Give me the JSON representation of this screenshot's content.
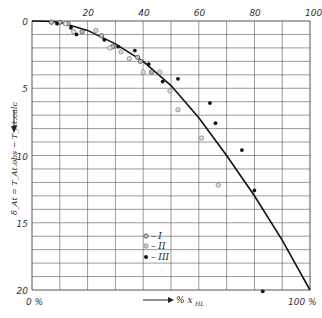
{
  "chart_data": {
    "type": "scatter",
    "title": "",
    "xlabel": "% x_HL",
    "ylabel": "δ_At = T_At.obs − T_At.calc",
    "xlim": [
      0,
      100
    ],
    "ylim": [
      0,
      20
    ],
    "y_inverted": true,
    "x_ticks": [
      "0 %",
      "20",
      "40",
      "60",
      "80",
      "100",
      "100 %"
    ],
    "x_tick_values": [
      20,
      40,
      60,
      80,
      100
    ],
    "y_ticks": [
      0,
      5,
      10,
      15,
      20
    ],
    "grid": true,
    "legend": [
      {
        "marker": "open-circle-dot",
        "label": "I"
      },
      {
        "marker": "gray-circle",
        "label": "II"
      },
      {
        "marker": "filled-dot",
        "label": "III"
      }
    ],
    "legend_position": "lower-center",
    "curve": {
      "name": "theoretical",
      "x": [
        0,
        5,
        10,
        20,
        30,
        40,
        50,
        60,
        70,
        80,
        90,
        100
      ],
      "y": [
        0,
        0.02,
        0.1,
        0.7,
        1.7,
        3.0,
        4.8,
        7.2,
        10.0,
        13.0,
        16.3,
        20.0
      ]
    },
    "series": [
      {
        "name": "I",
        "points": [
          [
            7,
            0.1
          ],
          [
            10,
            0.1
          ],
          [
            13,
            0.2
          ],
          [
            18,
            0.8
          ],
          [
            25,
            1.1
          ],
          [
            29,
            1.9
          ],
          [
            38,
            2.7
          ],
          [
            39,
            3.0
          ],
          [
            43,
            3.8
          ]
        ]
      },
      {
        "name": "II",
        "points": [
          [
            12,
            0.2
          ],
          [
            15,
            0.8
          ],
          [
            23,
            0.7
          ],
          [
            28,
            2.0
          ],
          [
            32,
            2.3
          ],
          [
            35,
            2.8
          ],
          [
            40,
            3.8
          ],
          [
            46,
            3.8
          ],
          [
            49.6,
            5.2
          ],
          [
            52.5,
            6.6
          ],
          [
            61,
            8.7
          ],
          [
            67,
            12.2
          ]
        ]
      },
      {
        "name": "III",
        "points": [
          [
            9,
            0.2
          ],
          [
            14,
            0.5
          ],
          [
            16,
            1.0
          ],
          [
            26,
            1.4
          ],
          [
            31,
            1.9
          ],
          [
            37,
            2.2
          ],
          [
            42,
            3.2
          ],
          [
            47,
            4.5
          ],
          [
            52.5,
            4.3
          ],
          [
            64,
            6.1
          ],
          [
            66,
            7.6
          ],
          [
            75.5,
            9.6
          ],
          [
            80,
            12.6
          ],
          [
            83,
            20.1
          ]
        ]
      }
    ]
  },
  "labels": {
    "x_axis": "% x",
    "x_axis_sub": "HL",
    "y_axis": "δ",
    "y_axis_full": "δ_At = T_At.obs − T_At.calc",
    "x_zero": "0 %",
    "x_hundred": "100 %",
    "legend_I": "– I",
    "legend_II": "– II",
    "legend_III": "– III"
  }
}
